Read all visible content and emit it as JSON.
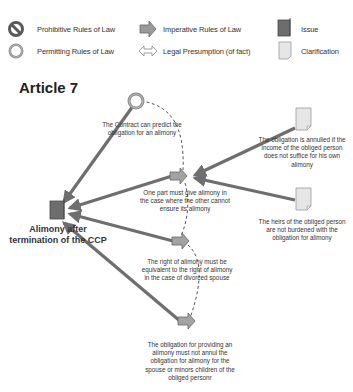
{
  "legend": {
    "items": [
      {
        "icon": "prohibitive-icon",
        "label": "Prohibitive Rules of Law"
      },
      {
        "icon": "permitting-icon",
        "label": "Permitting Rules of Law"
      },
      {
        "icon": "imperative-arrow-icon",
        "label": "Imperative Rules of Law"
      },
      {
        "icon": "legal-presumption-icon",
        "label": "Legal Presumption (of fact)"
      },
      {
        "icon": "issue-icon",
        "label": "Issue"
      },
      {
        "icon": "clarification-icon",
        "label": "Clarification"
      }
    ]
  },
  "title": "Article 7",
  "issue": {
    "label_line1": "Alimony after",
    "label_line2": "termination of the CCP"
  },
  "nodes": {
    "permitting": {
      "caption_line1": "The Contract can predict  the",
      "caption_line2": "obligation for an alimony"
    },
    "imperative_1": {
      "caption_line1": "One part must give alimony in",
      "caption_line2": "the case where the other cannot",
      "caption_line3": "ensure its alimony"
    },
    "imperative_2": {
      "caption_line1": "The right of alimony must be",
      "caption_line2": "equivalent to the right of alimony",
      "caption_line3": "in the case of divorced spouse"
    },
    "imperative_3": {
      "caption_line1": "The obligation for providing an",
      "caption_line2": "alimony must not annul the",
      "caption_line3": "obligation for alimony for the",
      "caption_line4": "spouse or minors children of the",
      "caption_line5": "obliged personr"
    },
    "clarification_1": {
      "caption_line1": "The obligation is annulled if the",
      "caption_line2": "income of the obliged person",
      "caption_line3": "does not suffice for his own",
      "caption_line4": "alimony"
    },
    "clarification_2": {
      "caption_line1": "The heirs of the obliged person",
      "caption_line2": "are not burdened with the",
      "caption_line3": "obligation for alimony"
    }
  },
  "colors": {
    "edge": "#6e6e6e",
    "issue_fill": "#6d6d6d",
    "arrow_fill": "#a3a3a3",
    "clarification_fill": "#e6e6e6",
    "dashed": "#555555"
  }
}
